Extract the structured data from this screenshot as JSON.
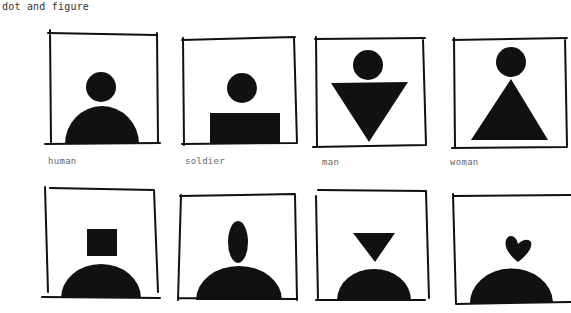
{
  "title": "dot and figure",
  "figures": [
    {
      "label": "human",
      "head": "circle",
      "body": "semicircle"
    },
    {
      "label": "soldier",
      "head": "circle",
      "body": "rectangle"
    },
    {
      "label": "man",
      "head": "circle",
      "body": "inverted-triangle"
    },
    {
      "label": "woman",
      "head": "circle",
      "body": "triangle"
    },
    {
      "label": "",
      "head": "square",
      "body": "semicircle"
    },
    {
      "label": "",
      "head": "ellipse",
      "body": "semicircle"
    },
    {
      "label": "",
      "head": "inverted-triangle",
      "body": "semicircle"
    },
    {
      "label": "",
      "head": "heart",
      "body": "semicircle"
    }
  ]
}
